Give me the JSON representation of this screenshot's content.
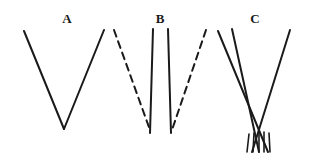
{
  "figure": {
    "background_color": "#ffffff",
    "stroke_color": "#1a1a1a",
    "width": 318,
    "height": 158,
    "panels": [
      {
        "id": "A",
        "label": "A",
        "label_x": 67,
        "label_y": 12,
        "description": "A wide V formed by two solid converging lines meeting at a point below.",
        "strokes": [
          {
            "name": "panel-a-left-arm",
            "type": "solid",
            "x1": 24,
            "y1": 31,
            "x2": 64,
            "y2": 129,
            "width": 2.0
          },
          {
            "name": "panel-a-right-arm",
            "type": "solid",
            "x1": 104,
            "y1": 30,
            "x2": 64,
            "y2": 129,
            "width": 2.0
          }
        ]
      },
      {
        "id": "B",
        "label": "B",
        "label_x": 160,
        "label_y": 12,
        "description": "Two nearly parallel solid vertical lines flanked by a dashed V of converging lines.",
        "strokes": [
          {
            "name": "panel-b-dashed-left-arm",
            "type": "dashed",
            "x1": 114,
            "y1": 30,
            "x2": 150,
            "y2": 130,
            "width": 2.0,
            "dash": "7 5"
          },
          {
            "name": "panel-b-dashed-right-arm",
            "type": "dashed",
            "x1": 206,
            "y1": 30,
            "x2": 172,
            "y2": 130,
            "width": 2.0,
            "dash": "7 5"
          },
          {
            "name": "panel-b-inner-line-left",
            "type": "solid",
            "x1": 153,
            "y1": 29,
            "x2": 150,
            "y2": 133,
            "width": 2.0
          },
          {
            "name": "panel-b-inner-line-right",
            "type": "solid",
            "x1": 168,
            "y1": 29,
            "x2": 171,
            "y2": 133,
            "width": 2.0
          }
        ]
      },
      {
        "id": "C",
        "label": "C",
        "label_x": 255,
        "label_y": 12,
        "description": "Three long converging solid lines crossing near the bottom, over a group of five short vertical hatch marks.",
        "strokes": [
          {
            "name": "panel-c-long-line-1",
            "type": "solid",
            "x1": 218,
            "y1": 31,
            "x2": 268,
            "y2": 152,
            "width": 2.0
          },
          {
            "name": "panel-c-long-line-2",
            "type": "solid",
            "x1": 232,
            "y1": 29,
            "x2": 259,
            "y2": 152,
            "width": 2.0
          },
          {
            "name": "panel-c-long-line-3",
            "type": "solid",
            "x1": 290,
            "y1": 30,
            "x2": 252,
            "y2": 152,
            "width": 2.0
          },
          {
            "name": "panel-c-hatch-1",
            "type": "solid",
            "x1": 249,
            "y1": 134,
            "x2": 247,
            "y2": 152,
            "width": 1.6
          },
          {
            "name": "panel-c-hatch-2",
            "type": "solid",
            "x1": 254,
            "y1": 133,
            "x2": 253,
            "y2": 152,
            "width": 1.6
          },
          {
            "name": "panel-c-hatch-3",
            "type": "solid",
            "x1": 259,
            "y1": 132,
            "x2": 259,
            "y2": 152,
            "width": 1.6
          },
          {
            "name": "panel-c-hatch-4",
            "type": "solid",
            "x1": 264,
            "y1": 132,
            "x2": 264,
            "y2": 152,
            "width": 1.6
          },
          {
            "name": "panel-c-hatch-5",
            "type": "solid",
            "x1": 269,
            "y1": 133,
            "x2": 270,
            "y2": 152,
            "width": 1.6
          }
        ]
      }
    ]
  }
}
